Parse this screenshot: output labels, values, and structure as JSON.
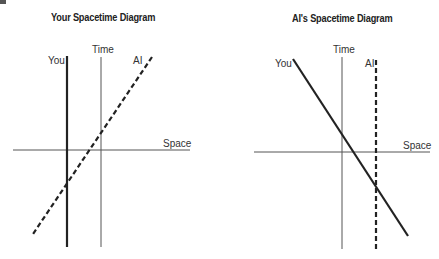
{
  "figure_marker": "2",
  "diagrams": [
    {
      "title": "Your Spacetime Diagram",
      "time_label": "Time",
      "space_label": "Space",
      "you_label": "You",
      "ai_label": "AI"
    },
    {
      "title": "AI's Spacetime Diagram",
      "time_label": "Time",
      "space_label": "Space",
      "you_label": "You",
      "ai_label": "AI"
    }
  ],
  "colors": {
    "axis": "#555555",
    "worldline": "#222222",
    "text": "#333333"
  }
}
